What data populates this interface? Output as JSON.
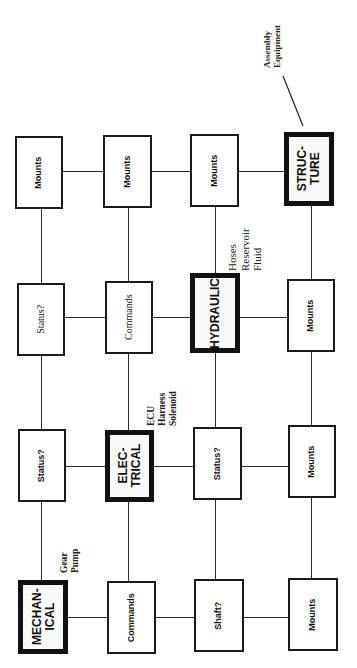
{
  "diagram": {
    "type": "grid-relationship-diagram",
    "orientation": "rotated 90deg counter-clockwise",
    "rows": [
      {
        "name": "mechanical-row",
        "boxes": [
          {
            "label_line1": "MECHAN-",
            "label_line2": "ICAL",
            "major": true
          },
          {
            "label_line1": "Commands",
            "label_line2": "",
            "major": false
          },
          {
            "label_line1": "Shaft?",
            "label_line2": "",
            "major": false
          },
          {
            "label_line1": "Mounts",
            "label_line2": "",
            "major": false
          }
        ]
      },
      {
        "name": "electrical-row",
        "boxes": [
          {
            "label_line1": "Status?",
            "label_line2": "",
            "major": false
          },
          {
            "label_line1": "ELEC-",
            "label_line2": "TRICAL",
            "major": true
          },
          {
            "label_line1": "Status?",
            "label_line2": "",
            "major": false
          },
          {
            "label_line1": "Mounts",
            "label_line2": "",
            "major": false
          }
        ]
      },
      {
        "name": "hydraulic-row",
        "boxes": [
          {
            "label_line1": "Status?",
            "label_line2": "",
            "major": false
          },
          {
            "label_line1": "Commands",
            "label_line2": "",
            "major": false
          },
          {
            "label_line1": "HYDRAULIC",
            "label_line2": "",
            "major": true
          },
          {
            "label_line1": "Mounts",
            "label_line2": "",
            "major": false
          }
        ]
      },
      {
        "name": "structure-row",
        "boxes": [
          {
            "label_line1": "Mounts",
            "label_line2": "",
            "major": false
          },
          {
            "label_line1": "Mounts",
            "label_line2": "",
            "major": false
          },
          {
            "label_line1": "Mounts",
            "label_line2": "",
            "major": false
          },
          {
            "label_line1": "STRUC-",
            "label_line2": "TURE",
            "major": true
          }
        ]
      }
    ],
    "annotations": {
      "mechanical": [
        "Gear",
        "Pump"
      ],
      "electrical": [
        "ECU",
        "Harness",
        "Solenoid"
      ],
      "hydraulic": [
        "Hoses",
        "Reservoir",
        "Fluid"
      ],
      "structure": [
        "Assembly",
        "Equipment"
      ]
    }
  }
}
